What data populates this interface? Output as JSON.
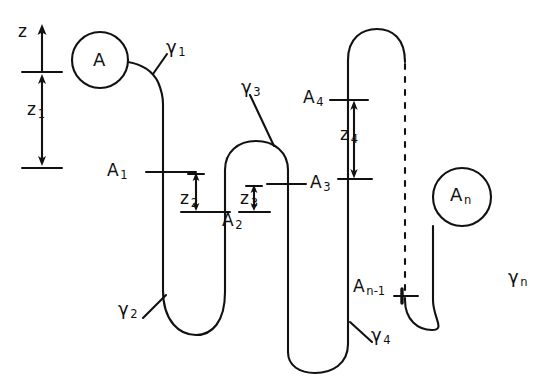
{
  "figure": {
    "type": "line-diagram",
    "background_color": "#ffffff",
    "stroke_color": "#111111"
  },
  "axis": {
    "name": "z",
    "label": "z",
    "arrow_direction": "up"
  },
  "labels": [
    {
      "key": "axis_z",
      "base": "z",
      "sub": "",
      "x": 18,
      "y": 30,
      "name": "axis-label-z"
    },
    {
      "key": "z1",
      "base": "z",
      "sub": "1",
      "x": 27,
      "y": 108,
      "name": "measure-label-z1"
    },
    {
      "key": "z2",
      "base": "z",
      "sub": "2",
      "x": 185,
      "y": 197,
      "name": "measure-label-z2"
    },
    {
      "key": "z3",
      "base": "z",
      "sub": "3",
      "x": 243,
      "y": 197,
      "name": "measure-label-z3"
    },
    {
      "key": "z4",
      "base": "z",
      "sub": "4",
      "x": 343,
      "y": 133,
      "name": "measure-label-z4"
    },
    {
      "key": "A",
      "base": "A",
      "sub": "",
      "x": 94,
      "y": 51,
      "name": "node-label-A"
    },
    {
      "key": "A1",
      "base": "A",
      "sub": "1",
      "x": 110,
      "y": 163,
      "name": "node-label-A1"
    },
    {
      "key": "A2",
      "base": "A",
      "sub": "2",
      "x": 225,
      "y": 219,
      "name": "node-label-A2"
    },
    {
      "key": "A3",
      "base": "A",
      "sub": "3",
      "x": 297,
      "y": 176,
      "name": "node-label-A3"
    },
    {
      "key": "A4",
      "base": "A",
      "sub": "4",
      "x": 306,
      "y": 92,
      "name": "node-label-A4"
    },
    {
      "key": "An_1",
      "base": "A",
      "sub": "n-1",
      "x": 355,
      "y": 282,
      "name": "node-label-An-1"
    },
    {
      "key": "An",
      "base": "A",
      "sub": "n",
      "x": 452,
      "y": 184,
      "name": "node-label-An"
    },
    {
      "key": "gamma1",
      "base": "γ",
      "sub": "1",
      "x": 156,
      "y": 40,
      "name": "turn-label-gamma1"
    },
    {
      "key": "gamma2",
      "base": "γ",
      "sub": "2",
      "x": 124,
      "y": 305,
      "name": "turn-label-gamma2"
    },
    {
      "key": "gamma3",
      "base": "γ",
      "sub": "3",
      "x": 243,
      "y": 81,
      "name": "turn-label-gamma3"
    },
    {
      "key": "gamma4",
      "base": "γ",
      "sub": "4",
      "x": 362,
      "y": 329,
      "name": "turn-label-gamma4"
    },
    {
      "key": "gamman",
      "base": "γ",
      "sub": "n",
      "x": 510,
      "y": 273,
      "name": "turn-label-gamma-n"
    }
  ],
  "chain": {
    "end_group_A": {
      "cx": 100,
      "cy": 60,
      "r": 28,
      "label": "A"
    },
    "end_group_An": {
      "cx": 462,
      "cy": 197,
      "r": 29,
      "label": "A n"
    },
    "strand_x_positions": [
      163,
      225,
      288,
      348,
      405,
      433
    ],
    "dashed_strand_x": 405,
    "tick_rows": {
      "A1": 172,
      "A2": 212,
      "A3": 184,
      "A4": 100,
      "An_1": 296,
      "z1_top": 72,
      "z1_bottom": 168,
      "z4_bottom": 179
    }
  },
  "measures": [
    {
      "name": "z1",
      "from_y": 72,
      "to_y": 168,
      "x": 42,
      "double_headed": true
    },
    {
      "name": "z2",
      "from_y": 172,
      "to_y": 212,
      "x": 196,
      "double_headed": true
    },
    {
      "name": "z3",
      "from_y": 184,
      "to_y": 212,
      "x": 254,
      "double_headed": true
    },
    {
      "name": "z4",
      "from_y": 100,
      "to_y": 179,
      "x": 354,
      "double_headed": true
    }
  ]
}
